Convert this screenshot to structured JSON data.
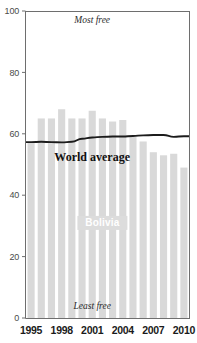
{
  "chart_data": {
    "type": "bar",
    "title": "",
    "xlabel": "",
    "ylabel": "",
    "ylim": [
      0,
      100
    ],
    "yticks": [
      0,
      20,
      40,
      60,
      80,
      100
    ],
    "ytick_labels": [
      "0",
      "20",
      "40",
      "60",
      "80",
      "100"
    ],
    "grid": false,
    "legend": "inline-labels",
    "categories": [
      "1995",
      "1996",
      "1997",
      "1998",
      "1999",
      "2000",
      "2001",
      "2002",
      "2003",
      "2004",
      "2005",
      "2006",
      "2007",
      "2008",
      "2009",
      "2010"
    ],
    "xtick_labels": [
      "1995",
      "1998",
      "2001",
      "2004",
      "2007",
      "2010"
    ],
    "xtick_categories": [
      "1995",
      "1998",
      "2001",
      "2004",
      "2007",
      "2010"
    ],
    "series": [
      {
        "name": "Bolivia",
        "type": "bar",
        "color": "#d9d9d9",
        "values": [
          57,
          65,
          65,
          68,
          65,
          65,
          67.5,
          65,
          64,
          64.5,
          59,
          57.5,
          54,
          53,
          53.5,
          49
        ]
      },
      {
        "name": "World average",
        "type": "line",
        "color": "#1c1c1c",
        "values": [
          57.3,
          57.4,
          57.3,
          57.2,
          57.4,
          58.4,
          58.8,
          59.0,
          59.1,
          59.1,
          59.3,
          59.5,
          59.6,
          59.6,
          59.0,
          59.2
        ]
      }
    ],
    "annotations": [
      {
        "name": "most-free",
        "text": "Most free",
        "x_category": "2001",
        "y_value": 96,
        "style": "italic"
      },
      {
        "name": "least-free",
        "text": "Least free",
        "x_category": "2001",
        "y_value": 3,
        "style": "italic"
      },
      {
        "name": "world-average-label",
        "text": "World average",
        "x_category": "2001",
        "y_value": 51,
        "style": "bold"
      },
      {
        "name": "bolivia-label",
        "text": "Bolivia",
        "x_category": "2002",
        "y_value": 30,
        "style": "bold-white"
      }
    ]
  },
  "colors": {
    "bar_fill": "#d9d9d9",
    "line_stroke": "#1c1c1c",
    "axis": "#6e6e6e",
    "tick_text": "#4a4a4a",
    "xtick_text": "#1a1a1a",
    "background": "#ffffff",
    "bolivia_label": "#ffffff"
  }
}
